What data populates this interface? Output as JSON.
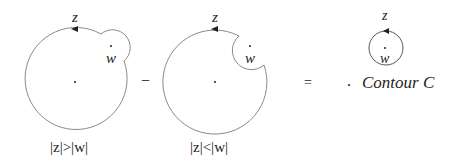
{
  "diagram": {
    "panels": [
      {
        "id": "outer-contour",
        "top_label": "z",
        "point_label": "w",
        "caption": "|z|>|w|",
        "shape": "circle with outward bump around w"
      },
      {
        "id": "inner-contour",
        "top_label": "z",
        "point_label": "w",
        "caption": "|z|<|w|",
        "shape": "circle with inward notch around w"
      },
      {
        "id": "small-contour",
        "top_label": "z",
        "point_label": "w",
        "shape": "small circle around w"
      }
    ],
    "operators": {
      "minus": "−",
      "equals": "="
    },
    "result_label": "Contour C",
    "result_dot": ".",
    "colors": {
      "stroke": "#8a8a8a",
      "text": "#222222"
    }
  }
}
